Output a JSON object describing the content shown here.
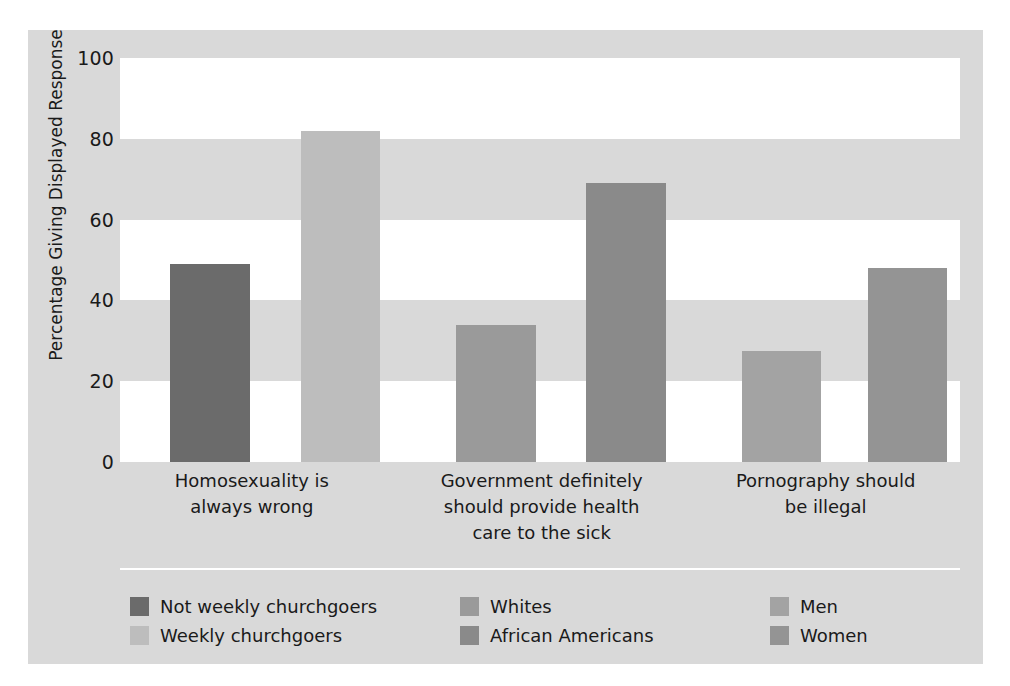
{
  "chart_data": {
    "type": "bar",
    "title": "",
    "subtitle": "",
    "xlabel": "",
    "ylabel": "Percentage Giving Displayed Response",
    "ylim": [
      0,
      100
    ],
    "yticks": [
      0,
      20,
      40,
      60,
      80,
      100
    ],
    "ytick_labels": [
      "0",
      "20",
      "40",
      "60",
      "80",
      "100"
    ],
    "grid": "horizontal alternating white and gray bands, no gridlines",
    "legend_position": "bottom, three columns of two entries",
    "categories": [
      "Homosexuality is\nalways wrong",
      "Government definitely\nshould provide health\ncare to the sick",
      "Pornography should\nbe illegal"
    ],
    "category_lines": [
      [
        "Homosexuality is",
        "always wrong"
      ],
      [
        "Government definitely",
        "should provide health",
        "care to the sick"
      ],
      [
        "Pornography should",
        "be illegal"
      ]
    ],
    "series": [
      {
        "name": "Not weekly churchgoers",
        "color": "#6b6b6b",
        "category": "Homosexuality is always wrong",
        "value": 49
      },
      {
        "name": "Weekly churchgoers",
        "color": "#bdbdbd",
        "category": "Homosexuality is always wrong",
        "value": 82
      },
      {
        "name": "Whites",
        "color": "#9a9a9a",
        "category": "Government definitely should provide health care to the sick",
        "value": 34
      },
      {
        "name": "African Americans",
        "color": "#8a8a8a",
        "category": "Government definitely should provide health care to the sick",
        "value": 69
      },
      {
        "name": "Men",
        "color": "#a3a3a3",
        "category": "Pornography should be illegal",
        "value": 27.5
      },
      {
        "name": "Women",
        "color": "#949494",
        "category": "Pornography should be illegal",
        "value": 48
      }
    ],
    "bars": [
      {
        "label": "Not weekly churchgoers",
        "value": 49,
        "color": "#6b6b6b",
        "x_pct": 6.0,
        "w_pct": 9.5
      },
      {
        "label": "Weekly churchgoers",
        "value": 82,
        "color": "#bdbdbd",
        "x_pct": 21.5,
        "w_pct": 9.5
      },
      {
        "label": "Whites",
        "value": 34,
        "color": "#9a9a9a",
        "x_pct": 40.0,
        "w_pct": 9.5
      },
      {
        "label": "African Americans",
        "value": 69,
        "color": "#8a8a8a",
        "x_pct": 55.5,
        "w_pct": 9.5
      },
      {
        "label": "Men",
        "value": 27.5,
        "color": "#a3a3a3",
        "x_pct": 74.0,
        "w_pct": 9.5
      },
      {
        "label": "Women",
        "value": 48,
        "color": "#949494",
        "x_pct": 89.0,
        "w_pct": 9.5
      }
    ],
    "bands": [
      {
        "from": 80,
        "to": 100,
        "fill": "white"
      },
      {
        "from": 40,
        "to": 60,
        "fill": "white"
      },
      {
        "from": 0,
        "to": 20,
        "fill": "white"
      }
    ]
  },
  "legend": {
    "columns": [
      {
        "items": [
          {
            "label": "Not weekly churchgoers",
            "color": "#6b6b6b"
          },
          {
            "label": "Weekly churchgoers",
            "color": "#bdbdbd"
          }
        ]
      },
      {
        "items": [
          {
            "label": "Whites",
            "color": "#9a9a9a"
          },
          {
            "label": "African Americans",
            "color": "#8a8a8a"
          }
        ]
      },
      {
        "items": [
          {
            "label": "Men",
            "color": "#a3a3a3"
          },
          {
            "label": "Women",
            "color": "#949494"
          }
        ]
      }
    ]
  },
  "theme": {
    "page_background": "#ffffff",
    "figure_background": "#d9d9d9",
    "band_white": "#ffffff",
    "text_color": "#1a1a1a",
    "rule_color": "#ffffff"
  }
}
